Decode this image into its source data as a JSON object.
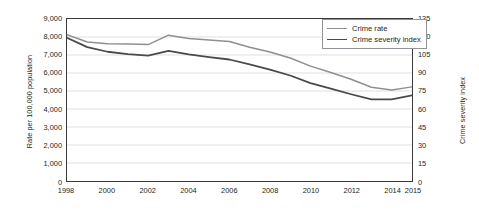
{
  "chart_data": {
    "type": "line",
    "title": "",
    "subtitle": "",
    "xlabel": "",
    "ylabel": "Rate per 100,000 population",
    "y2label": "Crime severity index",
    "grid": true,
    "legend_position": "top-right",
    "x": [
      1998,
      1999,
      2000,
      2001,
      2002,
      2003,
      2004,
      2005,
      2006,
      2007,
      2008,
      2009,
      2010,
      2011,
      2012,
      2013,
      2014,
      2015
    ],
    "xtick_labels": [
      "1998",
      "2000",
      "2002",
      "2004",
      "2006",
      "2008",
      "2010",
      "2012",
      "2014",
      "2015"
    ],
    "xtick_values": [
      1998,
      2000,
      2002,
      2004,
      2006,
      2008,
      2010,
      2012,
      2014,
      2015
    ],
    "xlim": [
      1998,
      2015
    ],
    "ylim": [
      0,
      9000
    ],
    "ytick_labels": [
      "0",
      "1,000",
      "2,000",
      "3,000",
      "4,000",
      "5,000",
      "6,000",
      "7,000",
      "8,000",
      "9,000"
    ],
    "ytick_values": [
      0,
      1000,
      2000,
      3000,
      4000,
      5000,
      6000,
      7000,
      8000,
      9000
    ],
    "y2lim": [
      0,
      135
    ],
    "y2tick_labels": [
      "0",
      "15",
      "30",
      "45",
      "60",
      "75",
      "90",
      "105",
      "120",
      "135"
    ],
    "y2tick_values": [
      0,
      15,
      30,
      45,
      60,
      75,
      90,
      105,
      120,
      135
    ],
    "series": [
      {
        "name": "Crime rate",
        "axis": "left",
        "color": "#8d8f92",
        "width": 1.5,
        "values": [
          8130,
          7720,
          7620,
          7610,
          7580,
          8100,
          7920,
          7830,
          7750,
          7430,
          7170,
          6830,
          6380,
          6030,
          5650,
          5210,
          5050,
          5230
        ]
      },
      {
        "name": "Crime severity index",
        "axis": "right",
        "color": "#4a4a4c",
        "width": 1.8,
        "values": [
          7960,
          7440,
          7180,
          7050,
          6970,
          7230,
          7030,
          6880,
          6750,
          6480,
          6190,
          5860,
          5440,
          5130,
          4820,
          4530,
          4530,
          4760
        ],
        "values_right_axis": [
          119.4,
          111.6,
          107.7,
          105.8,
          104.6,
          108.5,
          105.5,
          103.2,
          101.3,
          97.2,
          92.9,
          87.9,
          81.6,
          77.0,
          72.3,
          68.0,
          68.0,
          71.4
        ]
      }
    ]
  },
  "legend": {
    "items": [
      {
        "label": "Crime rate",
        "color": "#8d8f92",
        "width": 1.5
      },
      {
        "label": "Crime severity index",
        "color": "#4a4a4c",
        "width": 1.8
      }
    ]
  },
  "axes": {
    "left_title": "Rate per 100,000 population",
    "right_title": "Crime severity index"
  }
}
